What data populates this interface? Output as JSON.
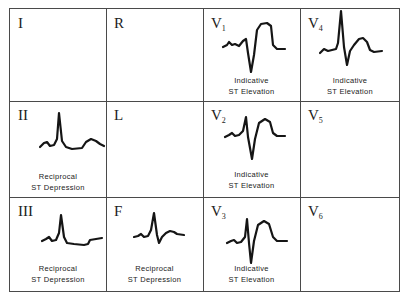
{
  "diagram": {
    "title": "",
    "leads": [
      {
        "id": "I",
        "label": "I",
        "sub": "",
        "caption1": "",
        "caption2": "",
        "trace": "none"
      },
      {
        "id": "R",
        "label": "R",
        "sub": "",
        "caption1": "",
        "caption2": "",
        "trace": "none"
      },
      {
        "id": "V1",
        "label": "V",
        "sub": "1",
        "caption1": "Indicative",
        "caption2": "ST Elevation",
        "trace": "st-elevation"
      },
      {
        "id": "V4",
        "label": "V",
        "sub": "4",
        "caption1": "Indicative",
        "caption2": "ST Elevation",
        "trace": "st-elevation"
      },
      {
        "id": "II",
        "label": "II",
        "sub": "",
        "caption1": "Reciprocal",
        "caption2": "ST Depression",
        "trace": "st-depression"
      },
      {
        "id": "L",
        "label": "L",
        "sub": "",
        "caption1": "",
        "caption2": "",
        "trace": "none"
      },
      {
        "id": "V2",
        "label": "V",
        "sub": "2",
        "caption1": "Indicative",
        "caption2": "ST Elevation",
        "trace": "st-elevation"
      },
      {
        "id": "V5",
        "label": "V",
        "sub": "5",
        "caption1": "",
        "caption2": "",
        "trace": "none"
      },
      {
        "id": "III",
        "label": "III",
        "sub": "",
        "caption1": "Reciprocal",
        "caption2": "ST Depression",
        "trace": "st-depression"
      },
      {
        "id": "F",
        "label": "F",
        "sub": "",
        "caption1": "Reciprocal",
        "caption2": "ST Depression",
        "trace": "st-depression"
      },
      {
        "id": "V3",
        "label": "V",
        "sub": "3",
        "caption1": "Indicative",
        "caption2": "ST Elevation",
        "trace": "st-elevation"
      },
      {
        "id": "V6",
        "label": "V",
        "sub": "6",
        "caption1": "",
        "caption2": "",
        "trace": "none"
      }
    ]
  }
}
